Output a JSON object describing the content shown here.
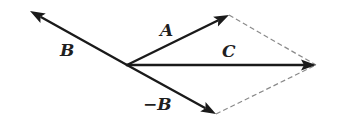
{
  "diagram": {
    "origin": {
      "x": 127,
      "y": 65
    },
    "vectors": [
      {
        "id": "A",
        "label": "A",
        "tip": {
          "x": 229,
          "y": 15
        },
        "label_pos": {
          "x": 160,
          "y": 36
        }
      },
      {
        "id": "B",
        "label": "B",
        "tip": {
          "x": 30,
          "y": 11
        },
        "label_pos": {
          "x": 60,
          "y": 56
        }
      },
      {
        "id": "C",
        "label": "C",
        "tip": {
          "x": 316,
          "y": 65
        },
        "label_pos": {
          "x": 222,
          "y": 57
        }
      },
      {
        "id": "negB",
        "label": "−B",
        "tip": {
          "x": 216,
          "y": 114
        },
        "label_pos": {
          "x": 143,
          "y": 110
        }
      }
    ],
    "construction_lines": [
      {
        "from": "A",
        "to": "C",
        "style": "dashed"
      },
      {
        "from": "negB",
        "to": "C",
        "style": "dashed"
      }
    ],
    "colors": {
      "vector": "#1a1a1a",
      "dashed": "#8a8a8a",
      "label": "#1f1f1f",
      "background": "#ffffff"
    }
  }
}
